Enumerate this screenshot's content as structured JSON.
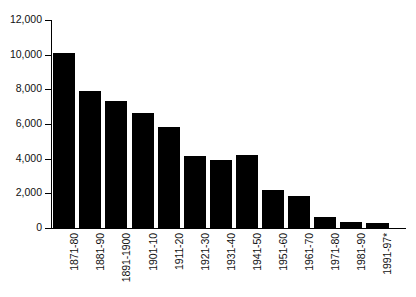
{
  "chart_data": {
    "type": "bar",
    "title": "",
    "subtitle": "",
    "xlabel": "",
    "ylabel": "",
    "ylim": [
      0,
      12000
    ],
    "ytick_labels": [
      "0",
      "2,000",
      "4,000",
      "6,000",
      "8,000",
      "10,000",
      "12,000"
    ],
    "ytick_values": [
      0,
      2000,
      4000,
      6000,
      8000,
      10000,
      12000
    ],
    "grid": false,
    "legend": null,
    "bar_color": "#000000",
    "axis_color": "#000000",
    "background_color": "#ffffff",
    "categories": [
      "1871-80",
      "1881-90",
      "1891-1900",
      "1901-10",
      "1911-20",
      "1921-30",
      "1931-40",
      "1941-50",
      "1951-60",
      "1961-70",
      "1971-80",
      "1981-90",
      "1991-97*"
    ],
    "values": [
      10100,
      7920,
      7300,
      6620,
      5830,
      4130,
      3940,
      4210,
      2210,
      1870,
      620,
      370,
      270
    ]
  }
}
